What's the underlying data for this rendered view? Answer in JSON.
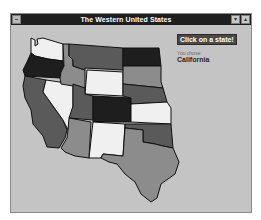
{
  "window": {
    "title": "The Western United States",
    "minimize_glyph": "▾",
    "maximize_glyph": "▴"
  },
  "panel": {
    "instruction": "Click on a state!",
    "chosen_caption": "You chose:",
    "chosen_value": "California"
  },
  "colors": {
    "window_bg": "#c4c4c4",
    "titlebar": "#1e1e1e",
    "white_state": "#f0f0f0",
    "light_state": "#8c8c8c",
    "mid_state": "#5a5a5a",
    "dark_state": "#1e1e1e"
  },
  "map": {
    "states": [
      {
        "name": "Washington",
        "shade": "white"
      },
      {
        "name": "Oregon",
        "shade": "dark"
      },
      {
        "name": "California",
        "shade": "mid"
      },
      {
        "name": "Nevada",
        "shade": "white"
      },
      {
        "name": "Idaho",
        "shade": "light"
      },
      {
        "name": "Montana",
        "shade": "mid"
      },
      {
        "name": "Wyoming",
        "shade": "white"
      },
      {
        "name": "Utah",
        "shade": "mid"
      },
      {
        "name": "Arizona",
        "shade": "light"
      },
      {
        "name": "Colorado",
        "shade": "dark"
      },
      {
        "name": "New Mexico",
        "shade": "white"
      },
      {
        "name": "North Dakota",
        "shade": "dark"
      },
      {
        "name": "South Dakota",
        "shade": "light"
      },
      {
        "name": "Nebraska",
        "shade": "mid"
      },
      {
        "name": "Kansas",
        "shade": "white"
      },
      {
        "name": "Oklahoma",
        "shade": "mid"
      },
      {
        "name": "Texas",
        "shade": "light"
      }
    ]
  }
}
